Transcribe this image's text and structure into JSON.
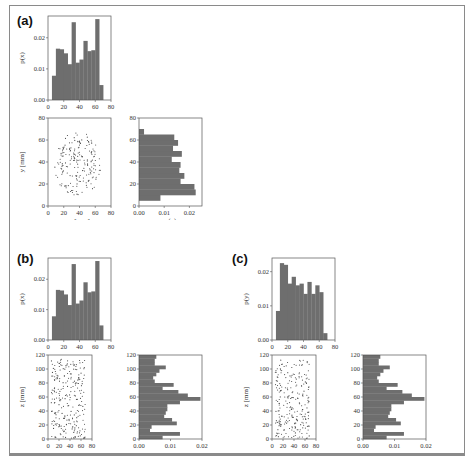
{
  "figure": {
    "panels": [
      {
        "id": "a",
        "label": "(a)"
      },
      {
        "id": "b",
        "label": "(b)"
      },
      {
        "id": "c",
        "label": "(c)"
      }
    ]
  },
  "chart_data": [
    {
      "panel": "(a)",
      "type": "bar",
      "title": "",
      "xlabel": "",
      "ylabel": "p(x)",
      "xlim": [
        0,
        80
      ],
      "ylim": [
        0,
        0.027
      ],
      "xticks": [
        "0",
        "20",
        "40",
        "60",
        "80"
      ],
      "yticks": [
        "0.00",
        "0.01",
        "0.02"
      ],
      "bin_edges": [
        5,
        10,
        15,
        20,
        25,
        30,
        35,
        40,
        45,
        50,
        55,
        60,
        65,
        70
      ],
      "values": [
        0.0078,
        0.0165,
        0.0163,
        0.015,
        0.0115,
        0.025,
        0.012,
        0.013,
        0.019,
        0.0157,
        0.016,
        0.026,
        0.0048
      ]
    },
    {
      "panel": "(a)",
      "type": "scatter",
      "xlabel": "x [mm]",
      "ylabel": "y [mm]",
      "xlim": [
        0,
        80
      ],
      "ylim": [
        0,
        80
      ],
      "xticks": [
        "0",
        "20",
        "40",
        "60",
        "80"
      ],
      "yticks": [
        "0",
        "20",
        "40",
        "60",
        "80"
      ],
      "description": "~200 points uniformly within a disc centered ~(38,38) radius ~30"
    },
    {
      "panel": "(a)",
      "type": "bar",
      "orientation": "horizontal",
      "xlabel": "p(y)",
      "ylabel": "",
      "xlim": [
        0,
        0.025
      ],
      "ylim": [
        0,
        80
      ],
      "xticks": [
        "0.00",
        "0.01",
        "0.02"
      ],
      "yticks": [
        "0",
        "20",
        "40",
        "60",
        "80"
      ],
      "bin_edges": [
        5,
        10,
        15,
        20,
        25,
        30,
        35,
        40,
        45,
        50,
        55,
        60,
        65,
        70
      ],
      "values": [
        0.0085,
        0.0225,
        0.022,
        0.0165,
        0.018,
        0.016,
        0.0165,
        0.013,
        0.017,
        0.0135,
        0.0155,
        0.014,
        0.002
      ]
    },
    {
      "panel": "(b)",
      "type": "bar",
      "xlabel": "",
      "ylabel": "p(x)",
      "xlim": [
        0,
        80
      ],
      "ylim": [
        0,
        0.027
      ],
      "xticks": [
        "0",
        "20",
        "40",
        "60",
        "80"
      ],
      "yticks": [
        "0.00",
        "0.01",
        "0.02"
      ],
      "bin_edges": [
        5,
        10,
        15,
        20,
        25,
        30,
        35,
        40,
        45,
        50,
        55,
        60,
        65,
        70
      ],
      "values": [
        0.0078,
        0.0165,
        0.0163,
        0.015,
        0.0115,
        0.025,
        0.012,
        0.013,
        0.019,
        0.0157,
        0.016,
        0.026,
        0.0048
      ]
    },
    {
      "panel": "(b)",
      "type": "scatter",
      "xlabel": "x [mm]",
      "ylabel": "z [mm]",
      "xlim": [
        0,
        80
      ],
      "ylim": [
        0,
        120
      ],
      "xticks": [
        "0",
        "20",
        "40",
        "60",
        "80"
      ],
      "yticks": [
        "0",
        "20",
        "40",
        "60",
        "80",
        "100",
        "120"
      ],
      "description": "~250 points spread over x 5-70, z 0-115"
    },
    {
      "panel": "(b)",
      "type": "bar",
      "orientation": "horizontal",
      "xlabel": "p(z)",
      "ylabel": "",
      "xlim": [
        0,
        0.02
      ],
      "ylim": [
        0,
        120
      ],
      "xticks": [
        "0.00",
        "0.01",
        "0.02"
      ],
      "yticks": [
        "0",
        "20",
        "40",
        "60",
        "80",
        "100",
        "120"
      ],
      "bin_width": 5,
      "bin_start": 0,
      "values": [
        0.0075,
        0.013,
        0.0035,
        0.004,
        0.012,
        0.0105,
        0.008,
        0.0085,
        0.009,
        0.009,
        0.013,
        0.0195,
        0.0155,
        0.0125,
        0.0075,
        0.011,
        0.005,
        0.0045,
        0.0055,
        0.0065,
        0.0085,
        0.005,
        0.005,
        0.0055
      ]
    },
    {
      "panel": "(c)",
      "type": "bar",
      "xlabel": "",
      "ylabel": "p(y)",
      "xlim": [
        0,
        80
      ],
      "ylim": [
        0,
        0.024
      ],
      "xticks": [
        "0",
        "20",
        "40",
        "60",
        "80"
      ],
      "yticks": [
        "0.00",
        "0.01",
        "0.02"
      ],
      "bin_edges": [
        5,
        10,
        15,
        20,
        25,
        30,
        35,
        40,
        45,
        50,
        55,
        60,
        65,
        70
      ],
      "values": [
        0.0085,
        0.0225,
        0.022,
        0.0165,
        0.0185,
        0.016,
        0.0165,
        0.0135,
        0.017,
        0.0135,
        0.016,
        0.014,
        0.002
      ]
    },
    {
      "panel": "(c)",
      "type": "scatter",
      "xlabel": "y [mm]",
      "ylabel": "z [mm]",
      "xlim": [
        0,
        80
      ],
      "ylim": [
        0,
        120
      ],
      "xticks": [
        "0",
        "20",
        "40",
        "60",
        "80"
      ],
      "yticks": [
        "0",
        "20",
        "40",
        "60",
        "80",
        "100",
        "120"
      ],
      "description": "~250 points spread over y 5-70, z 0-115"
    },
    {
      "panel": "(c)",
      "type": "bar",
      "orientation": "horizontal",
      "xlabel": "p(z)",
      "ylabel": "",
      "xlim": [
        0,
        0.02
      ],
      "ylim": [
        0,
        120
      ],
      "xticks": [
        "0.00",
        "0.01",
        "0.02"
      ],
      "yticks": [
        "0",
        "20",
        "40",
        "60",
        "80",
        "100",
        "120"
      ],
      "bin_width": 5,
      "bin_start": 0,
      "values": [
        0.0075,
        0.013,
        0.0035,
        0.004,
        0.012,
        0.0105,
        0.008,
        0.0085,
        0.009,
        0.009,
        0.013,
        0.0195,
        0.0155,
        0.0125,
        0.0075,
        0.011,
        0.005,
        0.0045,
        0.0055,
        0.0065,
        0.0085,
        0.005,
        0.005,
        0.0055
      ]
    }
  ],
  "colors": {
    "bar": "#6e6e6e",
    "point": "#444444",
    "axis": "#555555",
    "frame": "#8a8a8a"
  }
}
